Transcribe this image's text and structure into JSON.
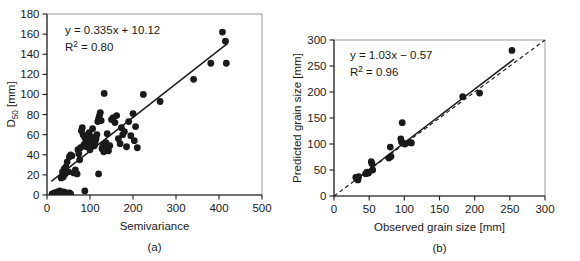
{
  "figure": {
    "background_color": "#ffffff",
    "ink_color": "#1a1a1a",
    "panels": [
      "(a)",
      "(b)"
    ]
  },
  "panel_a": {
    "caption": "(a)",
    "equation": "y = 0.335x + 10.12",
    "r_squared_prefix": "R",
    "r_squared_exponent": "2",
    "r_squared_value": " = 0.80"
  },
  "panel_b": {
    "caption": "(b)",
    "equation": "y = 1.03x − 0.57",
    "r_squared_prefix": "R",
    "r_squared_exponent": "2",
    "r_squared_value": " = 0.96"
  },
  "chart_data": [
    {
      "type": "scatter",
      "title": "",
      "panel": "(a)",
      "xlabel": "Semivariance",
      "ylabel_main": "D",
      "ylabel_sub": "50",
      "ylabel_unit": " [mm]",
      "ylabel": "D50 [mm]",
      "xlim": [
        0,
        500
      ],
      "ylim": [
        0,
        180
      ],
      "xticks": [
        0,
        100,
        200,
        300,
        400,
        500
      ],
      "yticks": [
        0,
        20,
        40,
        60,
        80,
        100,
        120,
        140,
        160,
        180
      ],
      "grid": false,
      "legend": "none",
      "annotations": [
        "y = 0.335x + 10.12",
        "R2 = 0.80"
      ],
      "fit_line": {
        "style": "solid",
        "slope": 0.335,
        "intercept": 10.12,
        "x_start": 10,
        "x_end": 420,
        "label": "y = 0.335x + 10.12"
      },
      "r_squared": 0.8,
      "marker": "filled-circle",
      "points": [
        [
          12,
          1
        ],
        [
          17,
          2
        ],
        [
          20,
          1
        ],
        [
          24,
          3
        ],
        [
          27,
          2
        ],
        [
          30,
          4
        ],
        [
          33,
          1
        ],
        [
          36,
          2
        ],
        [
          39,
          3
        ],
        [
          42,
          1
        ],
        [
          45,
          2
        ],
        [
          48,
          1
        ],
        [
          52,
          2
        ],
        [
          55,
          1
        ],
        [
          88,
          4
        ],
        [
          120,
          21
        ],
        [
          33,
          17
        ],
        [
          36,
          23
        ],
        [
          38,
          18
        ],
        [
          40,
          26
        ],
        [
          42,
          21
        ],
        [
          44,
          28
        ],
        [
          47,
          33
        ],
        [
          50,
          23
        ],
        [
          52,
          38
        ],
        [
          55,
          40
        ],
        [
          58,
          39
        ],
        [
          62,
          22
        ],
        [
          66,
          25
        ],
        [
          70,
          21
        ],
        [
          72,
          45
        ],
        [
          74,
          41
        ],
        [
          76,
          35
        ],
        [
          78,
          47
        ],
        [
          80,
          64
        ],
        [
          82,
          67
        ],
        [
          84,
          60
        ],
        [
          86,
          50
        ],
        [
          88,
          57
        ],
        [
          90,
          52
        ],
        [
          92,
          48
        ],
        [
          95,
          55
        ],
        [
          98,
          62
        ],
        [
          100,
          45
        ],
        [
          102,
          58
        ],
        [
          104,
          51
        ],
        [
          106,
          66
        ],
        [
          108,
          54
        ],
        [
          110,
          49
        ],
        [
          112,
          53
        ],
        [
          114,
          56
        ],
        [
          116,
          60
        ],
        [
          118,
          73
        ],
        [
          120,
          76
        ],
        [
          122,
          79
        ],
        [
          124,
          82
        ],
        [
          126,
          74
        ],
        [
          128,
          46
        ],
        [
          130,
          50
        ],
        [
          132,
          43
        ],
        [
          133,
          101
        ],
        [
          135,
          48
        ],
        [
          137,
          52
        ],
        [
          140,
          61
        ],
        [
          143,
          44
        ],
        [
          146,
          49
        ],
        [
          150,
          75
        ],
        [
          154,
          77
        ],
        [
          158,
          72
        ],
        [
          162,
          79
        ],
        [
          166,
          56
        ],
        [
          170,
          51
        ],
        [
          173,
          67
        ],
        [
          176,
          60
        ],
        [
          180,
          63
        ],
        [
          185,
          48
        ],
        [
          190,
          73
        ],
        [
          195,
          59
        ],
        [
          200,
          81
        ],
        [
          203,
          54
        ],
        [
          206,
          68
        ],
        [
          210,
          47
        ],
        [
          224,
          100
        ],
        [
          263,
          93
        ],
        [
          341,
          115
        ],
        [
          381,
          131
        ],
        [
          408,
          162
        ],
        [
          415,
          153
        ],
        [
          417,
          131
        ]
      ]
    },
    {
      "type": "scatter",
      "title": "",
      "panel": "(b)",
      "xlabel": "Observed grain size [mm]",
      "ylabel": "Predicted grain size [mm]",
      "xlim": [
        0,
        300
      ],
      "ylim": [
        0,
        300
      ],
      "xticks": [
        0,
        50,
        100,
        150,
        200,
        250,
        300
      ],
      "yticks": [
        0,
        50,
        100,
        150,
        200,
        250,
        300
      ],
      "grid": false,
      "legend": "none",
      "annotations": [
        "y = 1.03x − 0.57",
        "R2 = 0.96"
      ],
      "fit_line": {
        "style": "solid",
        "slope": 1.03,
        "intercept": -0.57,
        "x_start": 30,
        "x_end": 256,
        "label": "y = 1.03x − 0.57"
      },
      "reference_line": {
        "style": "dashed",
        "slope": 1.0,
        "intercept": 0,
        "x_start": 0,
        "x_end": 300,
        "label": "1:1 line"
      },
      "r_squared": 0.96,
      "marker": "filled-circle",
      "points": [
        [
          31,
          36
        ],
        [
          32,
          33
        ],
        [
          33,
          35
        ],
        [
          34,
          31
        ],
        [
          35,
          37
        ],
        [
          45,
          43
        ],
        [
          47,
          46
        ],
        [
          49,
          44
        ],
        [
          53,
          66
        ],
        [
          54,
          62
        ],
        [
          55,
          50
        ],
        [
          78,
          73
        ],
        [
          80,
          94
        ],
        [
          81,
          76
        ],
        [
          95,
          110
        ],
        [
          96,
          104
        ],
        [
          97,
          141
        ],
        [
          99,
          101
        ],
        [
          101,
          100
        ],
        [
          108,
          103
        ],
        [
          110,
          102
        ],
        [
          183,
          191
        ],
        [
          207,
          198
        ],
        [
          253,
          280
        ]
      ]
    }
  ]
}
